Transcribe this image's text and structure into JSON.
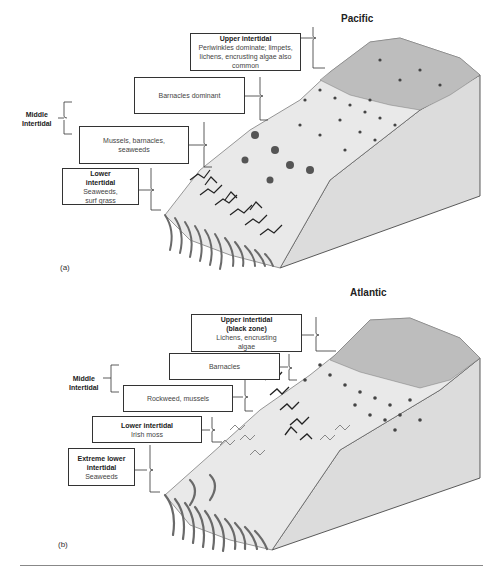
{
  "figure": {
    "panels": [
      {
        "tag": "(a)",
        "ocean": "Pacific",
        "side_label": {
          "line1": "Middle",
          "line2": "Intertidal"
        },
        "zones": [
          {
            "heading": "Upper intertidal",
            "text": "Periwinkles dominate; limpets, lichens, encrusting algae also common"
          },
          {
            "heading": "",
            "text": "Barnacles dominant"
          },
          {
            "heading": "",
            "text": "Mussels, barnacles, seaweeds"
          },
          {
            "heading": "Lower intertidal",
            "text": "Seaweeds, surf grass"
          }
        ]
      },
      {
        "tag": "(b)",
        "ocean": "Atlantic",
        "side_label": {
          "line1": "Middle",
          "line2": "Intertidal"
        },
        "zones": [
          {
            "heading": "Upper intertidal (black zone)",
            "text": "Lichens, encrusting algae"
          },
          {
            "heading": "",
            "text": "Barnacles"
          },
          {
            "heading": "",
            "text": "Rockweed, mussels"
          },
          {
            "heading": "Lower intertidal",
            "text": "Irish moss"
          },
          {
            "heading": "Extreme lower intertidal",
            "text": "Seaweeds"
          }
        ]
      }
    ],
    "colors": {
      "rock_face": "#dcdcdc",
      "rock_top": "#b8b8b8",
      "seaweed": "#6a6a6a",
      "dark_algae": "#222222",
      "outline": "#333333"
    }
  }
}
